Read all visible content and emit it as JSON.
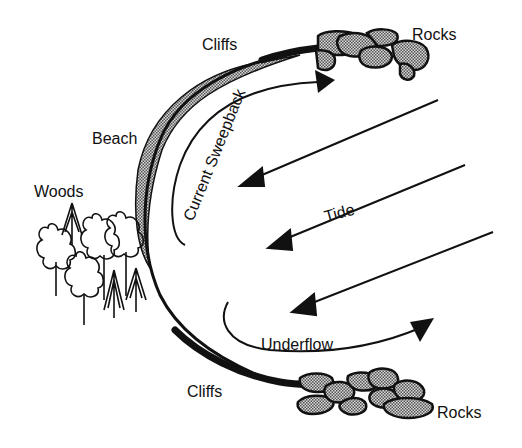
{
  "diagram": {
    "type": "coastal-current-diagram",
    "colors": {
      "ink": "#111111",
      "stipple": "#8a8a8a",
      "background": "#ffffff"
    },
    "labels": {
      "cliffs_top": "Cliffs",
      "rocks_top": "Rocks",
      "beach": "Beach",
      "woods": "Woods",
      "current_sweepback": "Current Sweepback",
      "tide": "Tide",
      "underflow": "Underflow",
      "cliffs_bottom": "Cliffs",
      "rocks_bottom": "Rocks"
    },
    "arrows": [
      {
        "name": "tide-arrow-1",
        "from": [
          438,
          100
        ],
        "to": [
          240,
          186
        ]
      },
      {
        "name": "tide-arrow-2",
        "from": [
          465,
          165
        ],
        "to": [
          268,
          248
        ]
      },
      {
        "name": "tide-arrow-3",
        "from": [
          493,
          232
        ],
        "to": [
          292,
          312
        ]
      }
    ]
  }
}
